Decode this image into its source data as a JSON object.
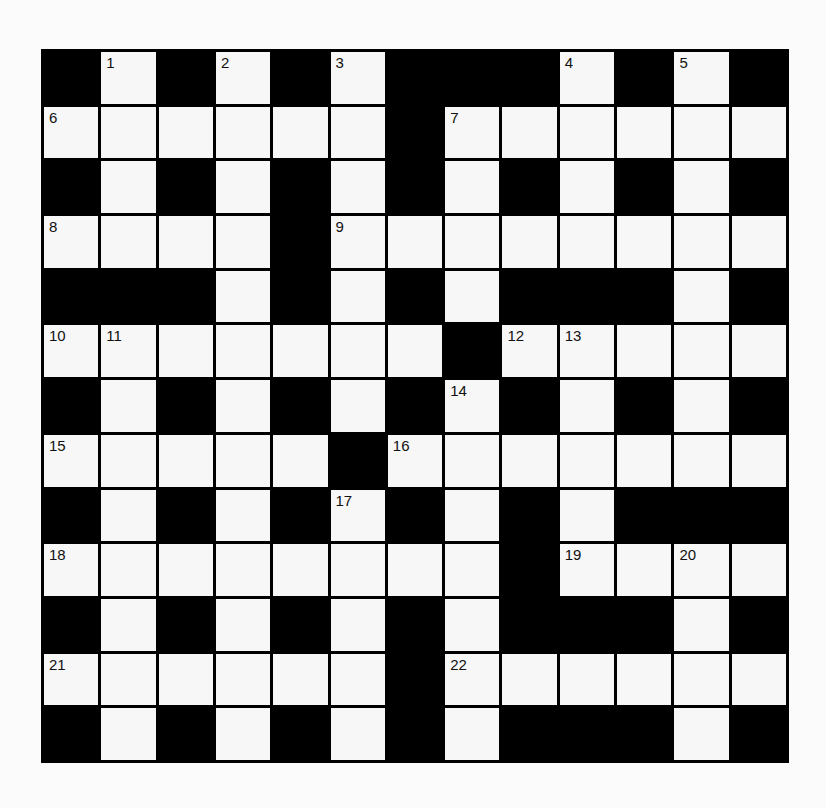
{
  "puzzle": {
    "rows": 13,
    "cols": 13,
    "colors": {
      "block": "#000000",
      "open": "#f7f7f7",
      "number": "#111111"
    },
    "layout": [
      "#.#.#.###.#.#",
      "......#......",
      "#.#.#.#.#.#.#",
      "....#........",
      "###.#.#.###.#",
      ".......#.....",
      "#.#.#.#.#.#.#",
      ".....#.......",
      "#.#.#.#.#.###",
      "........#....",
      "#.#.#.#.###.#",
      "......#......",
      "#.#.#.#.###.#"
    ],
    "numbers": [
      {
        "n": "1",
        "r": 0,
        "c": 1
      },
      {
        "n": "2",
        "r": 0,
        "c": 3
      },
      {
        "n": "3",
        "r": 0,
        "c": 5
      },
      {
        "n": "4",
        "r": 0,
        "c": 9
      },
      {
        "n": "5",
        "r": 0,
        "c": 11
      },
      {
        "n": "6",
        "r": 1,
        "c": 0
      },
      {
        "n": "7",
        "r": 1,
        "c": 7
      },
      {
        "n": "8",
        "r": 3,
        "c": 0
      },
      {
        "n": "9",
        "r": 3,
        "c": 5
      },
      {
        "n": "10",
        "r": 5,
        "c": 0
      },
      {
        "n": "11",
        "r": 5,
        "c": 1
      },
      {
        "n": "12",
        "r": 5,
        "c": 8
      },
      {
        "n": "13",
        "r": 5,
        "c": 9
      },
      {
        "n": "14",
        "r": 6,
        "c": 7
      },
      {
        "n": "15",
        "r": 7,
        "c": 0
      },
      {
        "n": "16",
        "r": 7,
        "c": 6
      },
      {
        "n": "17",
        "r": 8,
        "c": 5
      },
      {
        "n": "18",
        "r": 9,
        "c": 0
      },
      {
        "n": "19",
        "r": 9,
        "c": 9
      },
      {
        "n": "20",
        "r": 9,
        "c": 11
      },
      {
        "n": "21",
        "r": 11,
        "c": 0
      },
      {
        "n": "22",
        "r": 11,
        "c": 7
      }
    ]
  }
}
